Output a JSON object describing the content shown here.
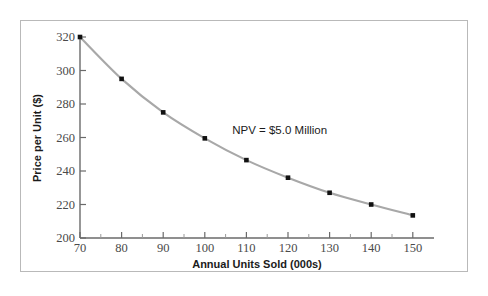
{
  "chart_data": {
    "type": "line",
    "title": "",
    "subtitle": "",
    "xlabel": "Annual Units Sold (000s)",
    "ylabel": "Price per Unit ($)",
    "xlim": [
      70,
      150
    ],
    "ylim": [
      200,
      320
    ],
    "grid": false,
    "legend": "none",
    "x_ticks": [
      70,
      80,
      90,
      100,
      110,
      120,
      130,
      140,
      150
    ],
    "x_tick_labels": [
      "70",
      "80",
      "90",
      "100",
      "110",
      "120",
      "130",
      "140",
      "150"
    ],
    "x_minor_ticks": [
      75,
      85,
      95,
      105,
      115,
      125,
      135,
      145
    ],
    "y_ticks": [
      200,
      220,
      240,
      260,
      280,
      300,
      320
    ],
    "y_tick_labels": [
      "200",
      "220",
      "240",
      "260",
      "280",
      "300",
      "320"
    ],
    "x": [
      70,
      80,
      90,
      100,
      110,
      120,
      130,
      140,
      150
    ],
    "series": [
      {
        "name": "NPV = $5.0 Million iso-curve",
        "values": [
          320,
          295,
          275,
          259.5,
          246.5,
          236,
          227,
          220,
          213.5
        ],
        "line_color": "#a8a8a8",
        "marker_color": "#111111",
        "marker": "square"
      }
    ],
    "annotations": [
      {
        "text": "NPV = $5.0 Million",
        "x": 118,
        "y": 262
      }
    ],
    "colors": {
      "line": "#a8a8a8",
      "marker": "#111111",
      "axis": "#6a6a6a",
      "frame": "#b9b9b9",
      "background": "#ffffff",
      "text": "#1b1b1b",
      "tick_text": "#4a4a4a"
    }
  },
  "axis_titles": {
    "x": "Annual Units Sold (000s)",
    "y": "Price per Unit ($)"
  },
  "annotation": {
    "npv_label": "NPV = $5.0 Million"
  },
  "y_labels": {
    "t0": "200",
    "t1": "220",
    "t2": "240",
    "t3": "260",
    "t4": "280",
    "t5": "300",
    "t6": "320"
  },
  "x_labels": {
    "t0": "70",
    "t1": "80",
    "t2": "90",
    "t3": "100",
    "t4": "110",
    "t5": "120",
    "t6": "130",
    "t7": "140",
    "t8": "150"
  }
}
